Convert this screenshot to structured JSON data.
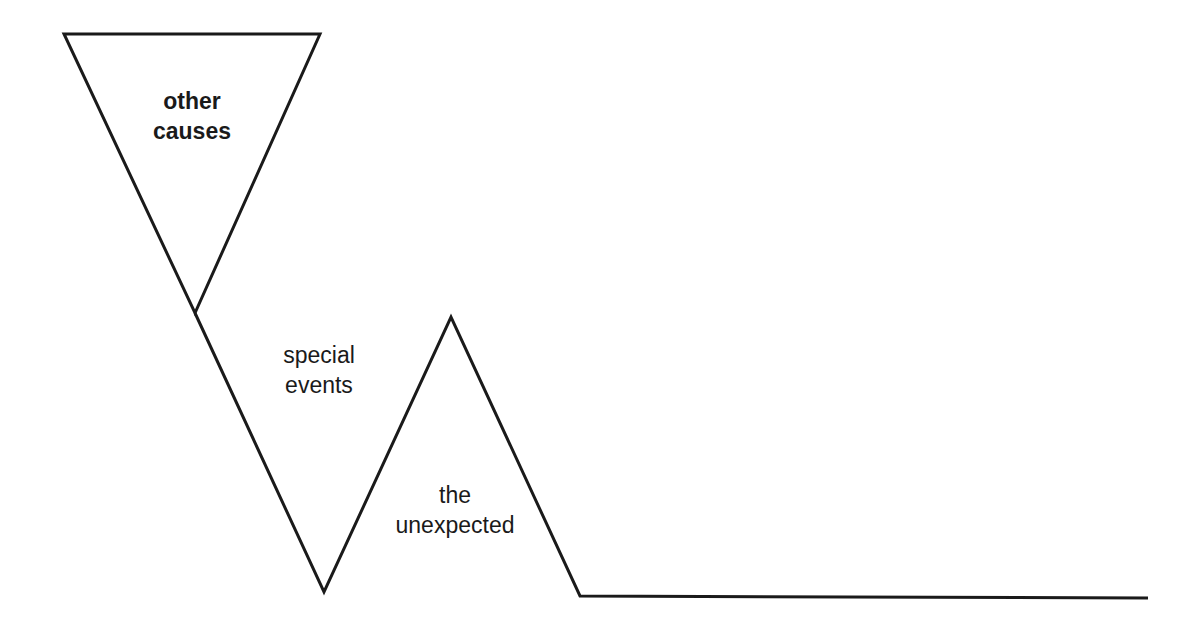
{
  "diagram": {
    "labels": {
      "other_causes": [
        "other",
        "causes"
      ],
      "special_events": [
        "special",
        "events"
      ],
      "the_unexpected": [
        "the",
        "unexpected"
      ]
    },
    "colors": {
      "stroke": "#1a1a1a",
      "background": "#ffffff"
    }
  }
}
